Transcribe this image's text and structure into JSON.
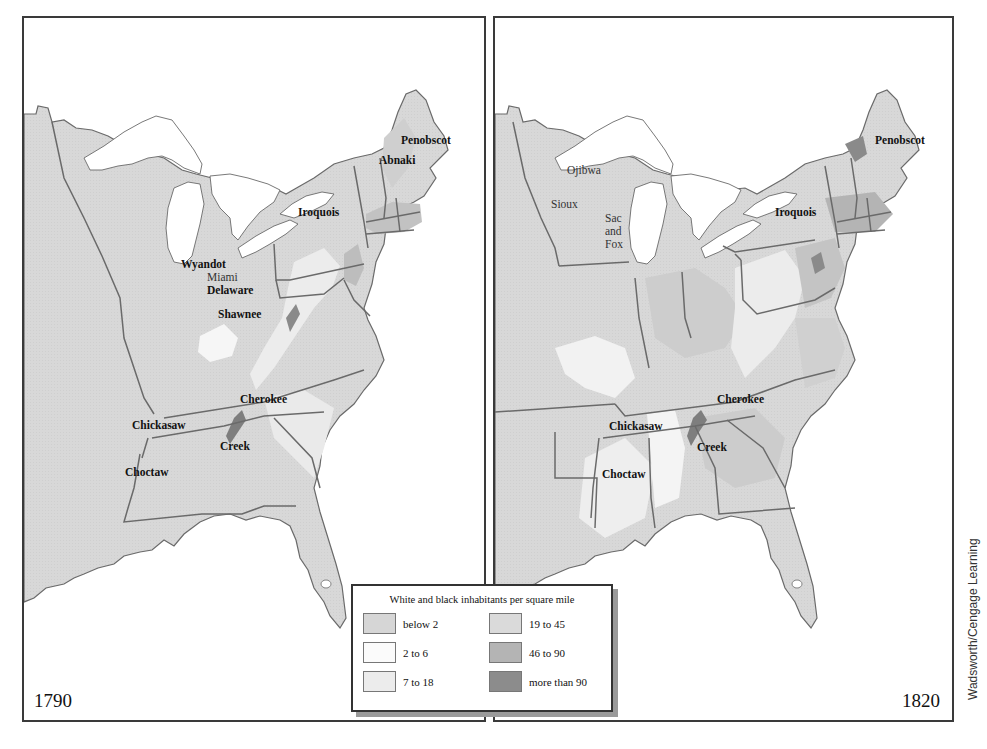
{
  "figure": {
    "legend": {
      "title": "White and black inhabitants per square mile",
      "items": [
        {
          "label": "below 2",
          "color": "#d6d6d6"
        },
        {
          "label": "19 to 45",
          "color": "#dadada"
        },
        {
          "label": "2 to 6",
          "color": "#fbfbfb"
        },
        {
          "label": "46 to 90",
          "color": "#b4b4b4"
        },
        {
          "label": "7 to 18",
          "color": "#ececec"
        },
        {
          "label": "more than 90",
          "color": "#8c8c8c"
        }
      ]
    },
    "credit": "Wadsworth/Cengage Learning",
    "colors": {
      "land": "#d8d8d8",
      "water": "#ffffff",
      "border": "#6a6a6a",
      "frame": "#3a3a3a"
    }
  },
  "maps": [
    {
      "year": "1790",
      "labels": [
        {
          "text": "Penobscot",
          "weight": "bold"
        },
        {
          "text": "Abnaki",
          "weight": "bold"
        },
        {
          "text": "Iroquois",
          "weight": "bold"
        },
        {
          "text": "Wyandot",
          "weight": "bold"
        },
        {
          "text": "Miami",
          "weight": "regular"
        },
        {
          "text": "Delaware",
          "weight": "bold"
        },
        {
          "text": "Shawnee",
          "weight": "bold"
        },
        {
          "text": "Cherokee",
          "weight": "bold"
        },
        {
          "text": "Chickasaw",
          "weight": "bold"
        },
        {
          "text": "Creek",
          "weight": "bold"
        },
        {
          "text": "Choctaw",
          "weight": "bold"
        }
      ]
    },
    {
      "year": "1820",
      "labels": [
        {
          "text": "Penobscot",
          "weight": "bold"
        },
        {
          "text": "Ojibwa",
          "weight": "regular"
        },
        {
          "text": "Sioux",
          "weight": "regular"
        },
        {
          "text": "Sac",
          "weight": "regular"
        },
        {
          "text": "and",
          "weight": "regular"
        },
        {
          "text": "Fox",
          "weight": "regular"
        },
        {
          "text": "Iroquois",
          "weight": "bold"
        },
        {
          "text": "Cherokee",
          "weight": "bold"
        },
        {
          "text": "Chickasaw",
          "weight": "bold"
        },
        {
          "text": "Creek",
          "weight": "bold"
        },
        {
          "text": "Choctaw",
          "weight": "bold"
        }
      ]
    }
  ]
}
